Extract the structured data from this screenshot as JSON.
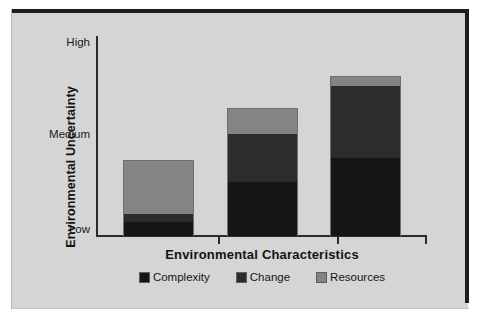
{
  "chart_data": {
    "type": "bar",
    "title": "",
    "subtitle": "",
    "xlabel": "Environmental Characteristics",
    "ylabel": "Environmental Uncertainty",
    "stacked": true,
    "grid": false,
    "legend_position": "bottom",
    "categories": [
      "Simple + Stable",
      "Complex + Stable",
      "Complex + Unstable"
    ],
    "category_labels_shown": false,
    "y_tick_labels": [
      "Low",
      "Medium",
      "High"
    ],
    "y_tick_values": [
      0,
      50,
      100
    ],
    "ylim": [
      0,
      100
    ],
    "series": [
      {
        "name": "Complexity",
        "color": "#151515",
        "values": [
          7,
          27,
          39
        ]
      },
      {
        "name": "Change",
        "color": "#2c2c2c",
        "values": [
          4,
          24,
          36
        ]
      },
      {
        "name": "Resources",
        "color": "#848484",
        "values": [
          27,
          13,
          5
        ]
      }
    ],
    "bar_totals": [
      38,
      64,
      80
    ],
    "annotations": []
  },
  "axes": {
    "y": {
      "title": "Environmental Uncertainty",
      "ticks": [
        {
          "label": "High",
          "value": 100
        },
        {
          "label": "Medium",
          "value": 50
        },
        {
          "label": "Low",
          "value": 0
        }
      ]
    },
    "x": {
      "title": "Environmental Characteristics",
      "tick_count": 3
    }
  },
  "legend": {
    "items": [
      {
        "label": "Complexity",
        "color": "#151515",
        "swatch": "filled-square-black"
      },
      {
        "label": "Change",
        "color": "#2c2c2c",
        "swatch": "filled-square-dark-gray"
      },
      {
        "label": "Resources",
        "color": "#848484",
        "swatch": "filled-square-gray"
      }
    ]
  },
  "colors": {
    "background": "#d5d5d5",
    "page": "#ffffff",
    "frame": "#1d1d1d",
    "axis": "#2a2a2a",
    "text": "#131313",
    "complexity": "#151515",
    "change": "#2c2c2c",
    "resources": "#848484"
  }
}
